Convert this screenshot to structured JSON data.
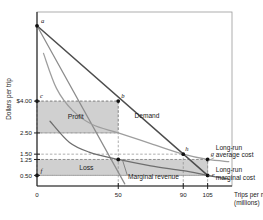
{
  "figure": {
    "background": "#ffffff",
    "plot_fill": "#ffffff"
  },
  "chart_data": {
    "type": "line",
    "title": "",
    "xlabel_line1": "Trips per month",
    "xlabel_line2": "(millions)",
    "ylabel": "Dollars per trip",
    "xlim": [
      0,
      120
    ],
    "ylim": [
      0,
      8.2
    ],
    "grid": false,
    "legend_position": "inline-right",
    "xticks": [
      0,
      50,
      90,
      105
    ],
    "xtick_labels": [
      "0",
      "50",
      "90",
      "105"
    ],
    "yticks": [
      4.0,
      2.5,
      1.5,
      1.25,
      0.5
    ],
    "ytick_labels": [
      "$4.00",
      "2.50",
      "1.50",
      "1.25",
      "0.50"
    ],
    "series": [
      {
        "name": "Demand",
        "label": "Demand",
        "color": "#4d4d4d",
        "type": "line",
        "points": [
          [
            0,
            7.55
          ],
          [
            105,
            0.5
          ]
        ]
      },
      {
        "name": "Marginal revenue",
        "label": "Marginal revenue",
        "color": "#8c8c8c",
        "type": "line",
        "points": [
          [
            0,
            7.55
          ],
          [
            54,
            0.1
          ]
        ]
      },
      {
        "name": "Long-run average cost",
        "label": "Long-run average cost",
        "color": "#9e9e9e",
        "type": "curve",
        "points": [
          [
            4,
            6.25
          ],
          [
            12,
            4.6
          ],
          [
            22,
            3.55
          ],
          [
            34,
            2.9
          ],
          [
            50,
            2.5
          ],
          [
            70,
            2.0
          ],
          [
            90,
            1.5
          ],
          [
            105,
            1.25
          ],
          [
            118,
            1.15
          ]
        ]
      },
      {
        "name": "Long-run marginal cost",
        "label": "Long-run marginal cost",
        "color": "#6e6e6e",
        "type": "curve",
        "points": [
          [
            8,
            3.05
          ],
          [
            20,
            2.05
          ],
          [
            32,
            1.6
          ],
          [
            50,
            1.25
          ],
          [
            70,
            0.95
          ],
          [
            90,
            0.72
          ],
          [
            105,
            0.5
          ],
          [
            118,
            0.32
          ]
        ]
      }
    ],
    "curve_labels": [
      {
        "id": "demand-label",
        "text": "Demand",
        "x": 60,
        "y": 3.2
      },
      {
        "id": "marginal-revenue-label",
        "text": "Marginal revenue",
        "x": 56,
        "y": 0.35
      },
      {
        "id": "lrac-label-line1",
        "text": "Long-run",
        "x": 110,
        "y": 1.72
      },
      {
        "id": "lrac-label-line2",
        "text": "average cost",
        "x": 110,
        "y": 1.38
      },
      {
        "id": "lrmc-label-line1",
        "text": "Long-run",
        "x": 110,
        "y": 0.66
      },
      {
        "id": "lrmc-label-line2",
        "text": "marginal cost",
        "x": 110,
        "y": 0.3
      }
    ],
    "regions": [
      {
        "id": "profit-region",
        "label": "Profit",
        "fill": "#c8c8c8",
        "x0": 0,
        "x1": 50,
        "y0": 2.5,
        "y1": 4.0
      },
      {
        "id": "loss-region",
        "label": "Loss",
        "fill": "#c8c8c8",
        "x0": 0,
        "x1": 105,
        "y0": 0.5,
        "y1": 1.25
      }
    ],
    "points": [
      {
        "id": "a",
        "label": "a",
        "x": 0,
        "y": 7.55
      },
      {
        "id": "b",
        "label": "b",
        "x": 50,
        "y": 4.0
      },
      {
        "id": "c",
        "label": "c",
        "x": 0,
        "y": 4.0
      },
      {
        "id": "d",
        "label": "",
        "x": 50,
        "y": 1.25
      },
      {
        "id": "e",
        "label": "e",
        "x": 105,
        "y": 0.5
      },
      {
        "id": "f",
        "label": "f",
        "x": 0,
        "y": 0.5
      },
      {
        "id": "g",
        "label": "g",
        "x": 105,
        "y": 1.25
      },
      {
        "id": "h",
        "label": "h",
        "x": 90,
        "y": 1.5
      }
    ],
    "dashed_color": "#8a8a8a",
    "annotations": []
  }
}
